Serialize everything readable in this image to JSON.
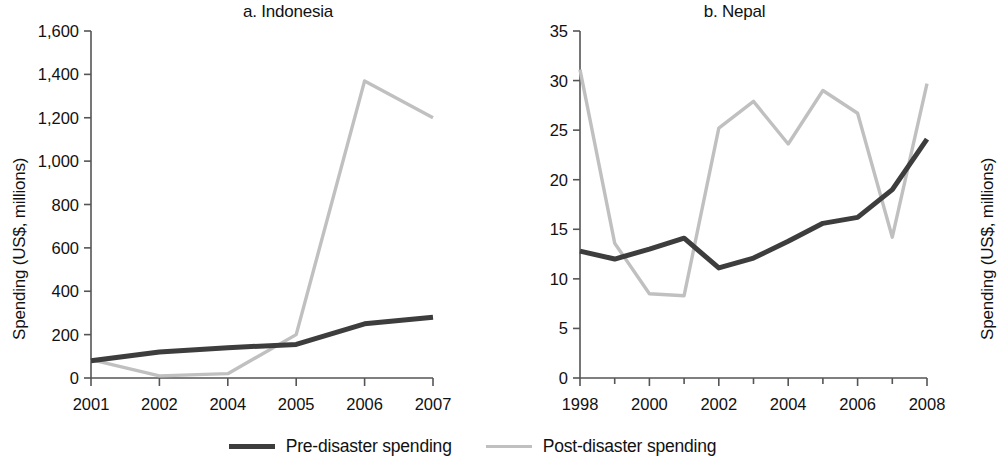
{
  "figure": {
    "ylabel": "Spending (US$, millions)"
  },
  "legend": {
    "items": [
      {
        "label": "Pre-disaster spending",
        "color": "#3d3d3d",
        "key": "pre"
      },
      {
        "label": "Post-disaster spending",
        "color": "#c0c0c0",
        "key": "post"
      }
    ]
  },
  "chart_data": [
    {
      "type": "line",
      "title": "a. Indonesia",
      "xlabel": "",
      "ylabel": "Spending (US$, millions)",
      "categories": [
        "2001",
        "2002",
        "2004",
        "2005",
        "2006",
        "2007"
      ],
      "xtick_labels": [
        "2001",
        "2002",
        "2004",
        "2005",
        "2006",
        "2007"
      ],
      "ytick_labels": [
        "0",
        "200",
        "400",
        "600",
        "800",
        "1,000",
        "1,200",
        "1,400",
        "1,600"
      ],
      "yticks": [
        0,
        200,
        400,
        600,
        800,
        1000,
        1200,
        1400,
        1600
      ],
      "ylim": [
        0,
        1600
      ],
      "grid": false,
      "legend_position": "bottom-center",
      "series": [
        {
          "name": "Pre-disaster spending",
          "color": "#3d3d3d",
          "values": [
            80,
            120,
            140,
            155,
            250,
            280
          ]
        },
        {
          "name": "Post-disaster spending",
          "color": "#c0c0c0",
          "values": [
            85,
            10,
            20,
            200,
            1370,
            1200
          ]
        }
      ]
    },
    {
      "type": "line",
      "title": "b. Nepal",
      "xlabel": "",
      "ylabel": "Spending (US$, millions)",
      "categories": [
        "1998",
        "1999",
        "2000",
        "2001",
        "2002",
        "2003",
        "2004",
        "2005",
        "2006",
        "2007",
        "2008"
      ],
      "xtick_labels": [
        "1998",
        "2000",
        "2002",
        "2004",
        "2006",
        "2008"
      ],
      "ytick_labels": [
        "0",
        "5",
        "10",
        "15",
        "20",
        "25",
        "30",
        "35"
      ],
      "yticks": [
        0,
        5,
        10,
        15,
        20,
        25,
        30,
        35
      ],
      "ylim": [
        0,
        35
      ],
      "grid": false,
      "legend_position": "bottom-center",
      "series": [
        {
          "name": "Pre-disaster spending",
          "color": "#3d3d3d",
          "values": [
            12.8,
            12.0,
            13.0,
            14.1,
            11.1,
            12.1,
            13.8,
            15.6,
            16.2,
            19.0,
            24.1
          ]
        },
        {
          "name": "Post-disaster spending",
          "color": "#c0c0c0",
          "values": [
            31.1,
            13.6,
            8.5,
            8.3,
            25.2,
            27.9,
            23.6,
            29.0,
            26.7,
            14.2,
            29.7
          ]
        }
      ]
    }
  ]
}
